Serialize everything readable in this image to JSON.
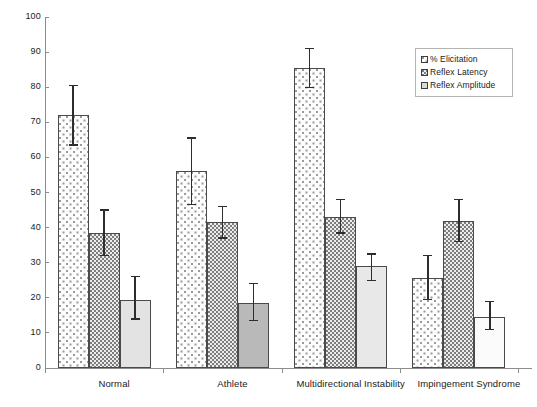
{
  "chart_data": {
    "type": "bar",
    "title": "",
    "subtitle": "",
    "xlabel": "",
    "ylabel": "",
    "ylim": [
      0,
      100
    ],
    "ytick_step": 10,
    "grid": false,
    "legend_position": "top-right",
    "error_bars": "present",
    "categories": [
      "Normal",
      "Athlete",
      "Multidirectional Instability",
      "Impingement Syndrome"
    ],
    "yticks": [
      "0",
      "10",
      "20",
      "30",
      "40",
      "50",
      "60",
      "70",
      "80",
      "90",
      "100"
    ],
    "series": [
      {
        "name": "% Elicitation",
        "fill": "sparse-dot-white",
        "values": [
          72,
          56,
          85.5,
          25.5
        ],
        "err_low": [
          63.5,
          46.5,
          80,
          19.5
        ],
        "err_high": [
          80.5,
          65.5,
          91,
          32
        ]
      },
      {
        "name": "Reflex Latency",
        "fill": "dense-dot-grey",
        "values": [
          38.5,
          41.5,
          43,
          42
        ],
        "err_low": [
          32,
          37,
          38.5,
          36
        ],
        "err_high": [
          45,
          46,
          48,
          48
        ]
      },
      {
        "name": "Reflex Amplitude",
        "fill": "solid-grey",
        "values": [
          19.5,
          18.5,
          29,
          14.5
        ],
        "err_low": [
          14,
          13.5,
          25,
          11
        ],
        "err_high": [
          26,
          24,
          32.5,
          19
        ],
        "group_shades": [
          "#e3e3e3",
          "#b9b9b9",
          "#e8e8e8",
          "#fbfbfb"
        ]
      }
    ]
  },
  "legend": {
    "items": [
      {
        "label": "% Elicitation"
      },
      {
        "label": "Reflex Latency"
      },
      {
        "label": "Reflex Amplitude"
      }
    ]
  },
  "colors": {
    "axis": "#8d8d8d",
    "bar_outline": "#4a4a4a",
    "error_bar": "#2d2d2d",
    "legend_border": "#b3b3b3",
    "text": "#1a1a1a",
    "background": "#ffffff"
  }
}
